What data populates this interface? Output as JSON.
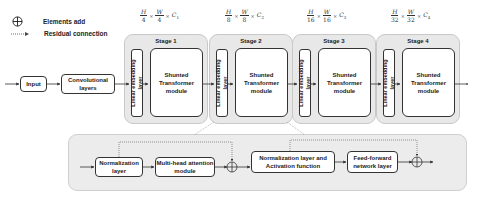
{
  "legend": {
    "elements_add": "Elements add",
    "residual_connection": "Residual connection"
  },
  "formulas": [
    {
      "h_num": "H",
      "h_den": "4",
      "w_num": "W",
      "w_den": "4",
      "c": "C",
      "c_sub": "1"
    },
    {
      "h_num": "H",
      "h_den": "8",
      "w_num": "W",
      "w_den": "8",
      "c": "C",
      "c_sub": "2"
    },
    {
      "h_num": "H",
      "h_den": "16",
      "w_num": "W",
      "w_den": "16",
      "c": "C",
      "c_sub": "3"
    },
    {
      "h_num": "H",
      "h_den": "32",
      "w_num": "W",
      "w_den": "32",
      "c": "C",
      "c_sub": "4"
    }
  ],
  "times_symbol": "×",
  "input_label": "Input",
  "conv_label": "Convolutional layers",
  "stages": [
    {
      "title": "Stage 1",
      "embed": "Linear embedding layer",
      "module": "Shunted Transformer module"
    },
    {
      "title": "Stage 2",
      "embed": "Linear embedding layer",
      "module": "Shunted Transformer module"
    },
    {
      "title": "Stage 3",
      "embed": "Linear embedding layer",
      "module": "Shunted Transformer module"
    },
    {
      "title": "Stage 4",
      "embed": "Linear embedding layer",
      "module": "Shunted Transformer module"
    }
  ],
  "detail": {
    "norm1": "Normalization layer",
    "mha": "Multi-head attention module",
    "norm2": "Normalization layer and Activation function",
    "ffn": "Feed-forward network layer"
  }
}
